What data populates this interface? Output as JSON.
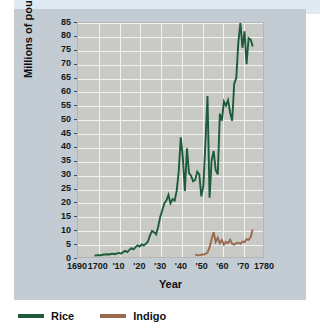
{
  "chart_data": {
    "type": "line",
    "title": "",
    "xlabel": "Year",
    "ylabel": "Millions of pounds",
    "xlim": [
      1690,
      1780
    ],
    "ylim": [
      0,
      85
    ],
    "grid": true,
    "legend_position": "bottom-left",
    "x_tick_labels": [
      "1690",
      "1700",
      "'10",
      "'20",
      "'30",
      "'40",
      "'50",
      "'60",
      "'70",
      "1780"
    ],
    "x_tick_values": [
      1690,
      1700,
      1710,
      1720,
      1730,
      1740,
      1750,
      1760,
      1770,
      1780
    ],
    "y_tick_labels": [
      "0",
      "5",
      "10",
      "15",
      "20",
      "25",
      "30",
      "35",
      "40",
      "45",
      "50",
      "55",
      "60",
      "65",
      "70",
      "75",
      "80",
      "85"
    ],
    "y_tick_values": [
      0,
      5,
      10,
      15,
      20,
      25,
      30,
      35,
      40,
      45,
      50,
      55,
      60,
      65,
      70,
      75,
      80,
      85
    ],
    "series": [
      {
        "name": "Rice",
        "color": "#1d5c3a",
        "x": [
          1698,
          1699,
          1700,
          1701,
          1702,
          1703,
          1704,
          1705,
          1706,
          1707,
          1708,
          1709,
          1710,
          1711,
          1712,
          1713,
          1714,
          1715,
          1716,
          1717,
          1718,
          1719,
          1720,
          1721,
          1722,
          1723,
          1724,
          1725,
          1726,
          1727,
          1728,
          1729,
          1730,
          1731,
          1732,
          1733,
          1734,
          1735,
          1736,
          1737,
          1738,
          1739,
          1740,
          1741,
          1742,
          1743,
          1744,
          1745,
          1746,
          1747,
          1748,
          1749,
          1750,
          1751,
          1752,
          1753,
          1754,
          1755,
          1756,
          1757,
          1758,
          1759,
          1760,
          1761,
          1762,
          1763,
          1764,
          1765,
          1766,
          1767,
          1768,
          1769,
          1770,
          1771,
          1772,
          1773,
          1774,
          1775
        ],
        "y": [
          0.5,
          0.6,
          0.7,
          0.6,
          0.8,
          0.9,
          1.0,
          0.9,
          1.1,
          1.2,
          1.0,
          1.3,
          1.5,
          1.2,
          1.8,
          2.2,
          1.8,
          2.6,
          3.2,
          2.8,
          3.6,
          4.2,
          3.8,
          4.6,
          4.2,
          4.8,
          5.6,
          7.8,
          9.5,
          9.0,
          8.2,
          11.0,
          14.5,
          17.0,
          19.5,
          20.5,
          22.5,
          19.5,
          21.0,
          20.5,
          24.0,
          31.0,
          43.5,
          36.0,
          24.0,
          39.5,
          30.5,
          29.5,
          27.5,
          28.0,
          31.0,
          30.0,
          22.0,
          26.0,
          41.5,
          58.5,
          21.5,
          35.0,
          38.5,
          31.5,
          30.0,
          52.0,
          49.5,
          56.5,
          55.0,
          57.0,
          52.5,
          49.5,
          63.0,
          65.0,
          78.0,
          85.0,
          76.0,
          82.0,
          70.0,
          79.5,
          79.0,
          76.5
        ]
      },
      {
        "name": "Indigo",
        "color": "#9a6a4e",
        "x": [
          1747,
          1748,
          1749,
          1750,
          1751,
          1752,
          1753,
          1754,
          1755,
          1756,
          1757,
          1758,
          1759,
          1760,
          1761,
          1762,
          1763,
          1764,
          1765,
          1766,
          1767,
          1768,
          1769,
          1770,
          1771,
          1772,
          1773,
          1774,
          1775
        ],
        "y": [
          1.0,
          0.6,
          0.7,
          0.8,
          0.9,
          1.1,
          1.6,
          3.5,
          6.5,
          9.0,
          5.5,
          7.0,
          5.0,
          6.2,
          4.5,
          5.5,
          5.0,
          6.3,
          4.8,
          4.5,
          5.0,
          5.2,
          4.8,
          5.6,
          5.4,
          6.5,
          6.2,
          7.2,
          10.0
        ]
      }
    ]
  },
  "axes": {
    "y_title": "Millions of pounds",
    "x_title": "Year"
  },
  "legend": {
    "items": [
      {
        "label": "Rice",
        "color": "#1d5c3a"
      },
      {
        "label": "Indigo",
        "color": "#9a6a4e"
      }
    ]
  },
  "colors": {
    "page_background": "#ffffff",
    "panel_background": "#c3cbd3",
    "plot_background": "#c9c9c5",
    "gridline": "#f2f2f0",
    "rice": "#1d5c3a",
    "indigo": "#9a6a4e",
    "text": "#14181c"
  }
}
